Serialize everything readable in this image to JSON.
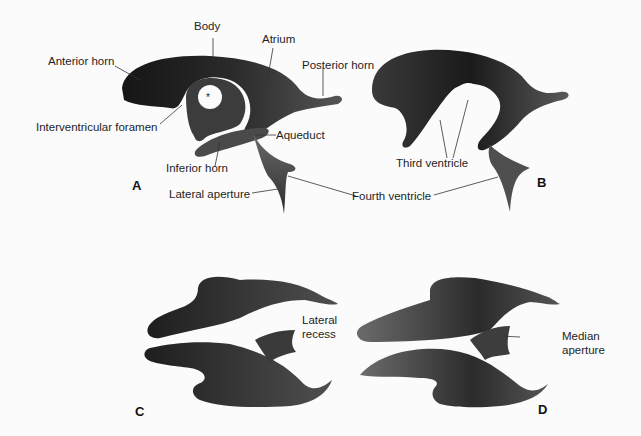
{
  "figure": {
    "panels": [
      {
        "letter": "A",
        "labels": {
          "body": "Body",
          "atrium": "Atrium",
          "anterior_horn": "Anterior horn",
          "posterior_horn": "Posterior horn",
          "interventricular_foramen": "Interventricular foramen",
          "aqueduct": "Aqueduct",
          "inferior_horn": "Inferior horn",
          "lateral_aperture": "Lateral aperture",
          "asterisk": "*"
        }
      },
      {
        "letter": "B",
        "labels": {
          "third_ventricle": "Third ventricle"
        }
      },
      {
        "letter": "C",
        "labels": {
          "lateral_recess_line1": "Lateral",
          "lateral_recess_line2": "recess"
        }
      },
      {
        "letter": "D",
        "labels": {
          "median_aperture_line1": "Median",
          "median_aperture_line2": "aperture"
        }
      }
    ],
    "shared_labels": {
      "fourth_ventricle": "Fourth ventricle"
    },
    "colors": {
      "background": "#fbfbfb",
      "cast_dark": "#1c1c1c",
      "cast_mid": "#4a4a4a",
      "cast_light": "#7a7a7a",
      "leader_line": "#333333",
      "text": "#1e1e1e"
    }
  }
}
